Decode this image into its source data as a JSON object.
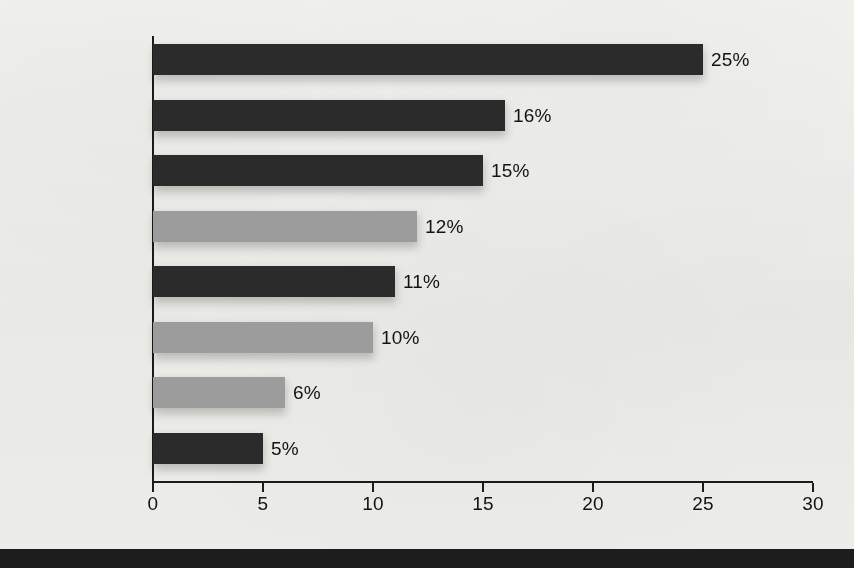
{
  "chart_data": {
    "type": "bar",
    "orientation": "horizontal",
    "title": "",
    "subtitle": "",
    "xlabel": "",
    "ylabel": "",
    "xlim": [
      0,
      30
    ],
    "grid": false,
    "legend": "none",
    "categories": [
      "Deny",
      "Discount",
      "Rationalize",
      "Eliminate",
      "Defend",
      "Acknowledge",
      "Condemn",
      "Encourage"
    ],
    "values": [
      25,
      16,
      15,
      12,
      11,
      10,
      6,
      5
    ],
    "value_labels": [
      "25%",
      "16%",
      "15%",
      "12%",
      "11%",
      "10%",
      "6%",
      "5%"
    ],
    "bar_colors": [
      "dark",
      "dark",
      "dark",
      "light",
      "dark",
      "light",
      "light",
      "dark"
    ],
    "xticks": [
      0,
      5,
      10,
      15,
      20,
      25,
      30
    ],
    "xtick_labels": [
      "0",
      "5",
      "10",
      "15",
      "20",
      "25",
      "30"
    ]
  },
  "colors": {
    "bar_dark": "#2b2b2b",
    "bar_light": "#9c9c9c",
    "axis": "#1b1b1b",
    "text": "#131313",
    "background": "#f5f5f3",
    "bottom_band": "#1d1d1d"
  }
}
